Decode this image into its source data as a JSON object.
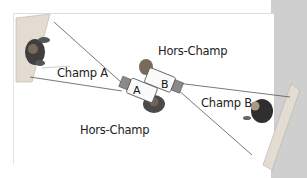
{
  "diagram": {
    "title": "",
    "labels": {
      "field_a": "Champ A",
      "field_b": "Champ B",
      "off_field_top": "Hors-Champ",
      "off_field_bottom": "Hors-Champ",
      "camera_a": "A",
      "camera_b": "B"
    },
    "colors": {
      "background": "#ffffff",
      "side_band": "#cfcfcf",
      "wall": "#d8d2c8",
      "lines": "#555555",
      "text": "#222222",
      "person": "#3a3a3a"
    }
  }
}
